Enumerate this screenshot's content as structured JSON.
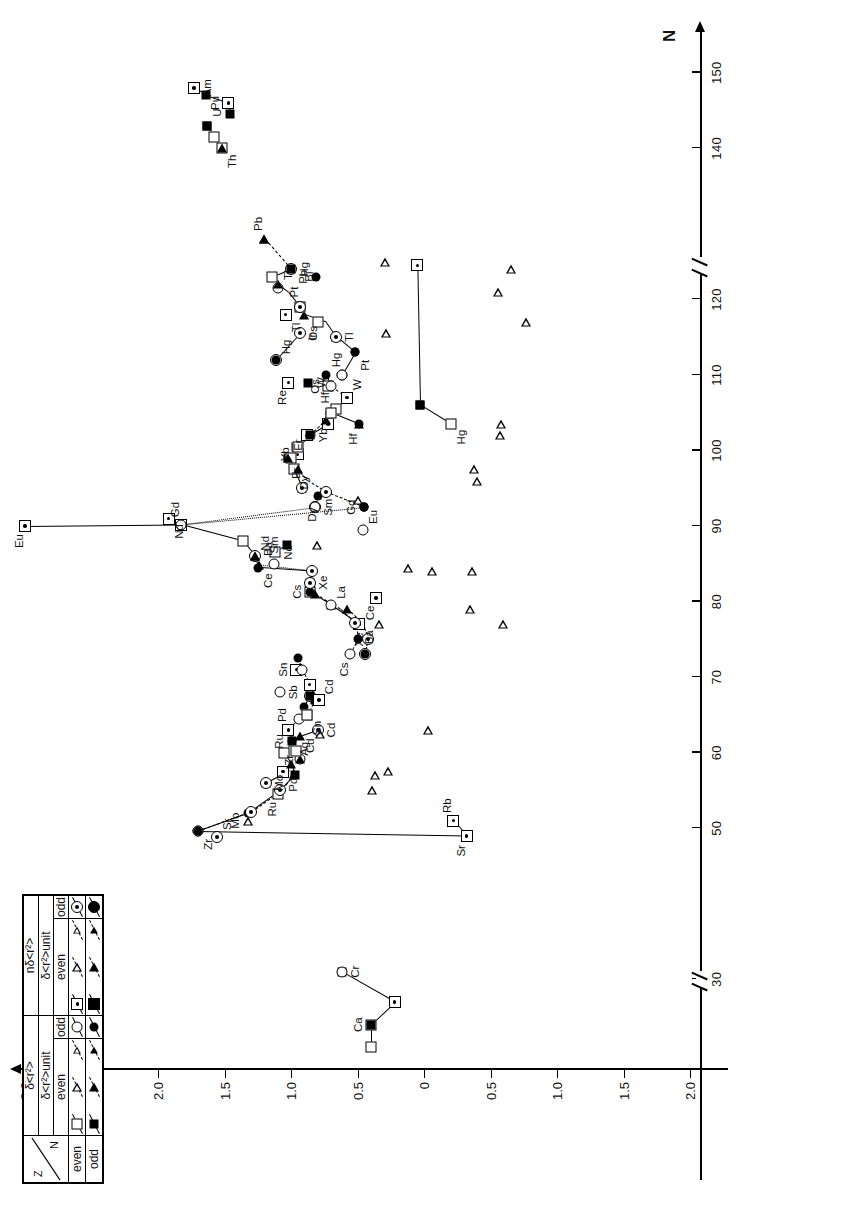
{
  "chart_data": {
    "type": "scatter",
    "title": "",
    "xlabel": "N",
    "ylabel_numerator": "δ<r²>A,A+2",
    "ylabel_denominator": "δ<r²>A,A+2 unit",
    "x_ticks": [
      30,
      50,
      60,
      70,
      80,
      90,
      100,
      110,
      120,
      140,
      150
    ],
    "x_tick_labels": [
      "30",
      "50",
      "60",
      "70",
      "80",
      "90",
      "100",
      "110",
      "120",
      "140",
      "150"
    ],
    "x_breaks": [
      40,
      132
    ],
    "y_ticks": [
      3.0,
      2.5,
      2.0,
      1.5,
      1.0,
      0.5,
      0,
      -0.5,
      -1.0,
      -1.5,
      -2.0
    ],
    "y_tick_labels": [
      "3.0",
      "2.5",
      "2.0",
      "1.5",
      "1.0",
      "0.5",
      "0",
      "0.5",
      "1.0",
      "1.5",
      "2.0"
    ],
    "ylim": [
      -2.0,
      3.0
    ],
    "grid": false,
    "legend_position": "top-right",
    "annotations": [
      {
        "label": "Ca",
        "x": 24,
        "y": 0.4
      },
      {
        "label": "Cr",
        "x": 31,
        "y": 0.62
      },
      {
        "label": "Sr",
        "x": 49,
        "y": -0.32
      },
      {
        "label": "Rb",
        "x": 51,
        "y": -0.22
      },
      {
        "label": "Zr",
        "x": 49.6,
        "y": 1.7
      },
      {
        "label": "Sr",
        "x": 48.8,
        "y": 1.56
      },
      {
        "label": "Mo",
        "x": 51,
        "y": 1.32
      },
      {
        "label": "Mo",
        "x": 56,
        "y": 1.19
      },
      {
        "label": "Ru",
        "x": 54.5,
        "y": 1.1
      },
      {
        "label": "Zr",
        "x": 57,
        "y": 0.97
      },
      {
        "label": "Pd",
        "x": 57.5,
        "y": 1.06
      },
      {
        "label": "Cd",
        "x": 59.2,
        "y": 0.93
      },
      {
        "label": "Ru",
        "x": 61.5,
        "y": 0.99
      },
      {
        "label": "Cd",
        "x": 63,
        "y": 0.8
      },
      {
        "label": "Ag",
        "x": 62.5,
        "y": 0.86
      },
      {
        "label": "Pd",
        "x": 63,
        "y": 1.02
      },
      {
        "label": "Sn",
        "x": 65,
        "y": 0.88
      },
      {
        "label": "Cd",
        "x": 67,
        "y": 0.79
      },
      {
        "label": "Sn",
        "x": 71,
        "y": 0.96
      },
      {
        "label": "Sb",
        "x": 68,
        "y": 1.08
      },
      {
        "label": "Cs",
        "x": 73,
        "y": 0.56
      },
      {
        "label": "Xe",
        "x": 73,
        "y": 0.44
      },
      {
        "label": "Ba",
        "x": 77,
        "y": 0.49
      },
      {
        "label": "La",
        "x": 79.5,
        "y": 0.7
      },
      {
        "label": "Cs",
        "x": 81.3,
        "y": 0.86
      },
      {
        "label": "Xe",
        "x": 82.5,
        "y": 0.86
      },
      {
        "label": "Ce",
        "x": 80.5,
        "y": 0.36
      },
      {
        "label": "Ba",
        "x": 85,
        "y": 1.13
      },
      {
        "label": "Ce",
        "x": 84.5,
        "y": 1.25
      },
      {
        "label": "Nd",
        "x": 86,
        "y": 1.27
      },
      {
        "label": "Sm",
        "x": 87.5,
        "y": 1.03
      },
      {
        "label": "Nd",
        "x": 86.5,
        "y": 1.12
      },
      {
        "label": "Eu",
        "x": 90,
        "y": 3.0
      },
      {
        "label": "Gd",
        "x": 90.2,
        "y": 1.83
      },
      {
        "label": "Nd",
        "x": 91,
        "y": 1.92
      },
      {
        "label": "Eu",
        "x": 89.5,
        "y": 0.46
      },
      {
        "label": "Gd",
        "x": 92.5,
        "y": 0.45
      },
      {
        "label": "Sm",
        "x": 92.5,
        "y": 0.82
      },
      {
        "label": "Dy",
        "x": 93.5,
        "y": 0.8
      },
      {
        "label": "Er",
        "x": 95,
        "y": 0.92
      },
      {
        "label": "Dy",
        "x": 97.5,
        "y": 0.98
      },
      {
        "label": "Er",
        "x": 99,
        "y": 1.02
      },
      {
        "label": "Yb",
        "x": 99.5,
        "y": 0.95
      },
      {
        "label": "Yb",
        "x": 102,
        "y": 0.86
      },
      {
        "label": "Hf",
        "x": 103.5,
        "y": 0.49
      },
      {
        "label": "Hf",
        "x": 105,
        "y": 0.7
      },
      {
        "label": "Hg",
        "x": 103.5,
        "y": -0.2
      },
      {
        "label": "W",
        "x": 107,
        "y": 0.58
      },
      {
        "label": "Os",
        "x": 108.5,
        "y": 0.72
      },
      {
        "label": "W",
        "x": 109,
        "y": 0.87
      },
      {
        "label": "Re",
        "x": 109,
        "y": 1.02
      },
      {
        "label": "Hg",
        "x": 110,
        "y": 0.62
      },
      {
        "label": "Pt",
        "x": 113,
        "y": 0.52
      },
      {
        "label": "Hg",
        "x": 112,
        "y": 1.11
      },
      {
        "label": "Os",
        "x": 115.5,
        "y": 0.74
      },
      {
        "label": "Tl",
        "x": 115,
        "y": 0.66
      },
      {
        "label": "Ir",
        "x": 117,
        "y": 0.8
      },
      {
        "label": "Pt",
        "x": 119,
        "y": 0.93
      },
      {
        "label": "Tl",
        "x": 118,
        "y": 1.04
      },
      {
        "label": "Tl",
        "x": 121.5,
        "y": 1.1
      },
      {
        "label": "Pb",
        "x": 123,
        "y": 0.81
      },
      {
        "label": "Hg",
        "x": 124,
        "y": 1.0
      },
      {
        "label": "Bi",
        "x": 125,
        "y": 0.82
      },
      {
        "label": "Pb",
        "x": 128,
        "y": 1.2
      },
      {
        "label": "Th",
        "x": 140,
        "y": 1.52
      },
      {
        "label": "U",
        "x": 143,
        "y": 1.63
      },
      {
        "label": "Pu",
        "x": 146,
        "y": 1.47
      },
      {
        "label": "Am",
        "x": 148,
        "y": 1.73
      }
    ]
  },
  "axes": {
    "n_axis_label": "N",
    "y_axis_numerator_main": "δ<r",
    "y_axis_exp": "2",
    "y_axis_numerator_tail": ">",
    "y_axis_sup_a": "A,A+2",
    "y_axis_den_sub": "unit",
    "x_tick_labels": [
      "30",
      "50",
      "60",
      "70",
      "80",
      "90",
      "100",
      "110",
      "120",
      "140",
      "150"
    ],
    "y_tick_labels": [
      "3.0",
      "2.5",
      "2.0",
      "1.5",
      "1.0",
      "0.5",
      "0",
      "0.5",
      "1.0",
      "1.5",
      "2.0"
    ]
  },
  "legend": {
    "corner_z": "Z",
    "corner_n": "N",
    "row_labels": [
      "even",
      "odd"
    ],
    "groups": [
      {
        "formula_num": "δ<r²>",
        "formula_den": "δ<r²>unit",
        "cols": [
          "even",
          "odd"
        ]
      },
      {
        "formula_num": "nδ<r²>",
        "formula_den": "δ<r²>unit",
        "cols": [
          "even",
          "odd"
        ]
      }
    ],
    "cells": [
      {
        "group": 0,
        "col": "even",
        "row": "even",
        "symbols": [
          "square-open",
          "triangle-open",
          "triangle-open-small"
        ]
      },
      {
        "group": 0,
        "col": "odd",
        "row": "even",
        "symbols": [
          "circle-open"
        ]
      },
      {
        "group": 1,
        "col": "even",
        "row": "even",
        "symbols": [
          "square-dot",
          "triangle-open",
          "triangle-open-small"
        ]
      },
      {
        "group": 1,
        "col": "odd",
        "row": "even",
        "symbols": [
          "circle-dot"
        ]
      },
      {
        "group": 0,
        "col": "even",
        "row": "odd",
        "symbols": [
          "square-filled",
          "triangle-filled",
          "triangle-filled-small"
        ]
      },
      {
        "group": 0,
        "col": "odd",
        "row": "odd",
        "symbols": [
          "circle-filled"
        ]
      },
      {
        "group": 1,
        "col": "even",
        "row": "odd",
        "symbols": [
          "square-filled-dot",
          "triangle-filled",
          "triangle-filled-small"
        ]
      },
      {
        "group": 1,
        "col": "odd",
        "row": "odd",
        "symbols": [
          "circle-filled-dot"
        ]
      }
    ]
  }
}
